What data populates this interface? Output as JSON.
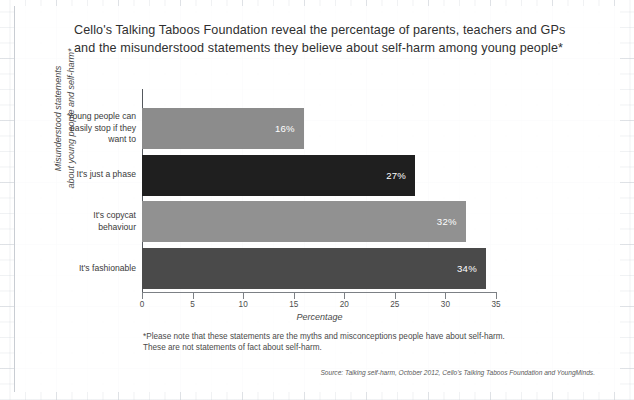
{
  "title": {
    "line1": "Cello's Talking Taboos Foundation reveal the percentage of parents, teachers and GPs",
    "line2": "and the misunderstood statements they believe about self-harm among young people*"
  },
  "chart_data": {
    "type": "bar",
    "orientation": "horizontal",
    "title": "Cello's Talking Taboos Foundation reveal the percentage of parents, teachers and GPs and the misunderstood statements they believe about self-harm among young people*",
    "categories": [
      "Young people can easily stop if they want to",
      "It's just a phase",
      "It's copycat behaviour",
      "It's fashionable"
    ],
    "values": [
      16,
      27,
      32,
      34
    ],
    "data_labels": [
      "16%",
      "27%",
      "32%",
      "34%"
    ],
    "bar_colors": [
      "#8c8c8c",
      "#1f1f1f",
      "#919191",
      "#4a4a4a"
    ],
    "xlabel": "Percentage",
    "ylabel": "Misunderstood statements about young people and self-harm*",
    "xlim": [
      0,
      35
    ],
    "xticks": [
      0,
      5,
      10,
      15,
      20,
      25,
      30,
      35
    ],
    "xticklabels": [
      "0",
      "5",
      "10",
      "15",
      "20",
      "25",
      "30",
      "35"
    ],
    "grid": false,
    "legend": "none"
  },
  "ylabel": {
    "line1": "Misunderstood statements",
    "line2": "about young people and self-harm*"
  },
  "categories": [
    {
      "lines": [
        "Young people can",
        "easily stop if they",
        "want to"
      ],
      "value": 16,
      "label": "16%",
      "color": "#8c8c8c"
    },
    {
      "lines": [
        "It's just a phase"
      ],
      "value": 27,
      "label": "27%",
      "color": "#1f1f1f"
    },
    {
      "lines": [
        "It's copycat",
        "behaviour"
      ],
      "value": 32,
      "label": "32%",
      "color": "#919191"
    },
    {
      "lines": [
        "It's fashionable"
      ],
      "value": 34,
      "label": "34%",
      "color": "#4a4a4a"
    }
  ],
  "footnote": {
    "line1": "*Please note that these statements are the myths and misconceptions people have about self-harm.",
    "line2": "These are not statements of fact about self-harm."
  },
  "source": "Source: Talking self-harm, October 2012, Cello's Talking Taboos Foundation and YoungMinds."
}
